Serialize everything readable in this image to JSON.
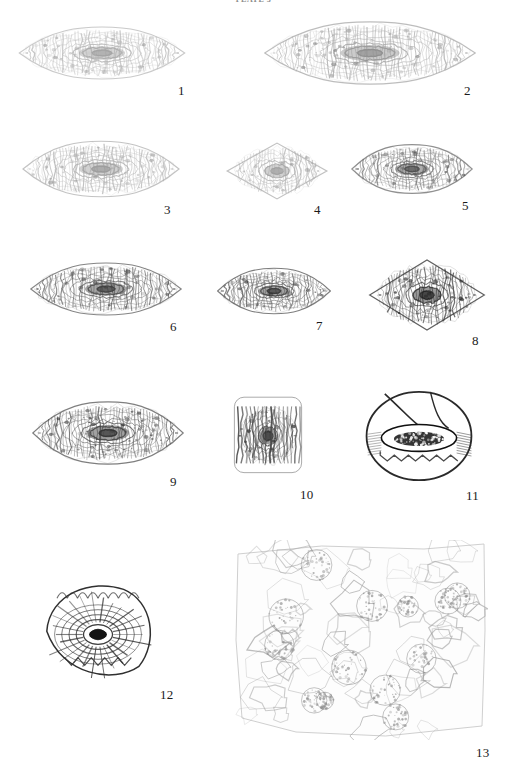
{
  "plate": {
    "title": "PLATE 3",
    "background_color": "#ffffff",
    "label_color": "#1a1a1a",
    "figure_count": 13,
    "content_type": "photomicrograph-plate",
    "subject": "fusulinid foraminifera thin sections"
  },
  "figures": [
    {
      "number": "1",
      "shape": "fusiform-axial-section",
      "tone": "very-light-gray",
      "ink": "#b9b9b9",
      "core": "#a0a0a0",
      "x": 14,
      "y": 22,
      "w": 176,
      "h": 62,
      "label_x": 178,
      "label_y": 84
    },
    {
      "number": "2",
      "shape": "broad-fusiform-axial-section",
      "tone": "medium-gray",
      "ink": "#a8a8a8",
      "core": "#8c8c8c",
      "x": 258,
      "y": 16,
      "w": 224,
      "h": 74,
      "label_x": 464,
      "label_y": 84
    },
    {
      "number": "3",
      "shape": "elongate-fusiform-axial-section",
      "tone": "light-gray",
      "ink": "#b0b0b0",
      "core": "#9a9a9a",
      "x": 18,
      "y": 136,
      "w": 166,
      "h": 66,
      "label_x": 164,
      "label_y": 203
    },
    {
      "number": "4",
      "shape": "rhomboid-sagittal-section",
      "tone": "light-gray",
      "ink": "#b2b2b2",
      "core": "#9c9c9c",
      "x": 224,
      "y": 140,
      "w": 106,
      "h": 62,
      "label_x": 314,
      "label_y": 203
    },
    {
      "number": "5",
      "shape": "lenticular-axial-section",
      "tone": "dark-gray",
      "ink": "#6d6d6d",
      "core": "#4a4a4a",
      "x": 348,
      "y": 140,
      "w": 128,
      "h": 58,
      "label_x": 462,
      "label_y": 199
    },
    {
      "number": "6",
      "shape": "fusiform-axial-section",
      "tone": "dark-gray",
      "ink": "#5e5e5e",
      "core": "#3c3c3c",
      "x": 26,
      "y": 258,
      "w": 160,
      "h": 62,
      "label_x": 170,
      "label_y": 320
    },
    {
      "number": "7",
      "shape": "compact-fusiform-axial-section",
      "tone": "dark-gray",
      "ink": "#545454",
      "core": "#333333",
      "x": 214,
      "y": 264,
      "w": 120,
      "h": 54,
      "label_x": 316,
      "label_y": 319
    },
    {
      "number": "8",
      "shape": "rhomboid-axial-section",
      "tone": "very-dark",
      "ink": "#3a3a3a",
      "core": "#1c1c1c",
      "x": 366,
      "y": 256,
      "w": 122,
      "h": 78,
      "label_x": 472,
      "label_y": 334
    },
    {
      "number": "9",
      "shape": "irregular-fusiform-axial-section",
      "tone": "dark-gray",
      "ink": "#555555",
      "core": "#2e2e2e",
      "x": 28,
      "y": 396,
      "w": 160,
      "h": 74,
      "label_x": 170,
      "label_y": 475
    },
    {
      "number": "10",
      "shape": "subquadrate-axial-section",
      "tone": "very-dark",
      "ink": "#474747",
      "core": "#242424",
      "x": 228,
      "y": 388,
      "w": 80,
      "h": 92,
      "label_x": 300,
      "label_y": 488
    },
    {
      "number": "11",
      "shape": "globular-oblique-section",
      "tone": "black-outline",
      "ink": "#2a2a2a",
      "core": "#101010",
      "x": 362,
      "y": 388,
      "w": 114,
      "h": 96,
      "label_x": 466,
      "label_y": 489
    },
    {
      "number": "12",
      "shape": "coiled-oblique-section",
      "tone": "dark-outline",
      "ink": "#303030",
      "core": "#141414",
      "x": 34,
      "y": 574,
      "w": 128,
      "h": 110,
      "label_x": 160,
      "label_y": 688
    },
    {
      "number": "13",
      "shape": "thin-section-aggregate-field",
      "tone": "light-gray-network",
      "ink": "#9f9f9f",
      "core": "#8a8a8a",
      "x": 232,
      "y": 540,
      "w": 256,
      "h": 200,
      "label_x": 476,
      "label_y": 746
    }
  ]
}
